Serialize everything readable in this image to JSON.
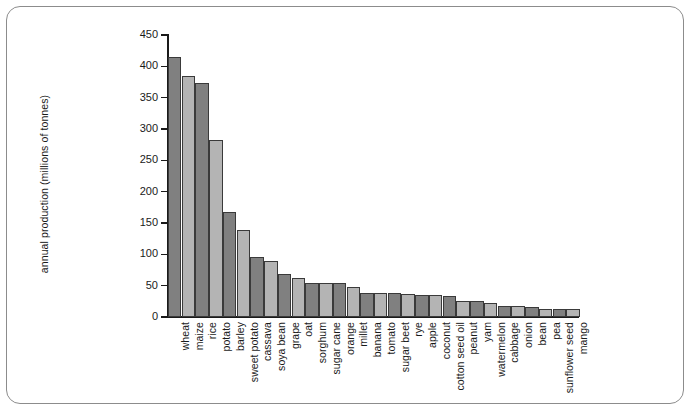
{
  "chart_data": {
    "type": "bar",
    "title": "",
    "xlabel": "",
    "ylabel": "annual production (millions of tonnes)",
    "ylim": [
      0,
      450
    ],
    "ytick_values": [
      0,
      50,
      100,
      150,
      200,
      250,
      300,
      350,
      400,
      450
    ],
    "ytick_labels": [
      "0",
      "50",
      "100",
      "150",
      "200",
      "250",
      "300",
      "350",
      "400",
      "450"
    ],
    "grid": false,
    "legend": "none",
    "bar_colors": {
      "dark": "#808080",
      "light": "#b4b4b4",
      "edge": "#3a3a3a"
    },
    "categories": [
      "wheat",
      "maize",
      "rice",
      "potato",
      "barley",
      "sweet potato",
      "cassava",
      "soya bean",
      "grape",
      "oat",
      "sorghum",
      "sugar cane",
      "orange",
      "millet",
      "banana",
      "tomato",
      "sugar beet",
      "rye",
      "apple",
      "coconut",
      "cotton seed oil",
      "peanut",
      "yam",
      "watermelon",
      "cabbage",
      "onion",
      "bean",
      "pea",
      "sunflower seed",
      "mango"
    ],
    "values": [
      415,
      385,
      373,
      283,
      168,
      139,
      96,
      90,
      68,
      62,
      55,
      55,
      55,
      48,
      39,
      38,
      38,
      36,
      35,
      35,
      33,
      26,
      25,
      23,
      18,
      18,
      16,
      13,
      13,
      13
    ]
  },
  "frame": {
    "border_color": "#8c8c8c",
    "background": "#ffffff"
  }
}
